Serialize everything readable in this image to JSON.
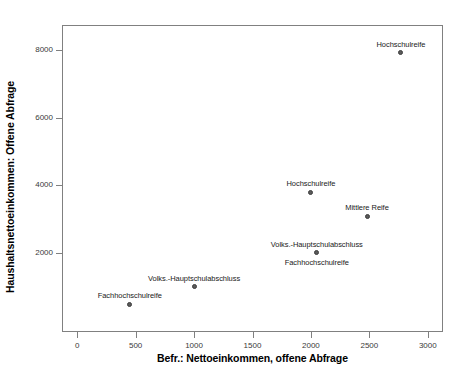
{
  "chart_data": {
    "type": "scatter",
    "title": "",
    "xlabel": "Befr.: Nettoeinkommen, offene Abfrage",
    "ylabel": "Haushaltsnettoeinkommen: Offene Abfrage",
    "xlim": [
      -130,
      3130
    ],
    "ylim": [
      -340,
      8740
    ],
    "grid": false,
    "legend": "none",
    "xticks": [
      0,
      500,
      1000,
      1500,
      2000,
      2500,
      3000
    ],
    "xticklabels": [
      "0",
      "500",
      "1000",
      "1500",
      "2000",
      "2500",
      "3000"
    ],
    "yticks": [
      2000,
      4000,
      6000,
      8000
    ],
    "yticklabels": [
      "2000",
      "4000",
      "6000",
      "8000"
    ],
    "points": [
      {
        "label": "Fachhochschulreife",
        "x": 450,
        "y": 480,
        "label_pos": "above"
      },
      {
        "label": "Volks.-Hauptschulabschluss",
        "x": 1000,
        "y": 1000,
        "label_pos": "above"
      },
      {
        "label": "Volks.-Hauptschulabschluss",
        "x": 2050,
        "y": 2000,
        "label_pos": "above"
      },
      {
        "label": "Fachhochschulreife",
        "x": 2050,
        "y": 2000,
        "label_pos": "below"
      },
      {
        "label": "Hochschulreife",
        "x": 2000,
        "y": 3800,
        "label_pos": "above"
      },
      {
        "label": "Mittlere Reife",
        "x": 2480,
        "y": 3080,
        "label_pos": "above"
      },
      {
        "label": "Hochschulreife",
        "x": 2770,
        "y": 7920,
        "label_pos": "above"
      }
    ],
    "marker_color": "#5a5a5a",
    "axis_color": "#808080"
  }
}
